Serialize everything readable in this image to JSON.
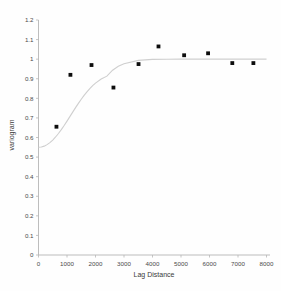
{
  "chart_data": {
    "type": "scatter",
    "title": "",
    "subtitle": "",
    "xlabel": "Lag Distance",
    "ylabel": "variogram",
    "xlim": [
      0,
      8000
    ],
    "ylim": [
      0,
      1.2
    ],
    "grid": false,
    "legend": null,
    "legend_position": "none",
    "xticks": [
      0,
      1000,
      2000,
      3000,
      4000,
      5000,
      6000,
      7000,
      8000
    ],
    "xtick_labels": [
      "0",
      "1000",
      "2000",
      "3000",
      "4000",
      "5000",
      "6000",
      "7000",
      "8000"
    ],
    "yticks": [
      0,
      0.1,
      0.2,
      0.3,
      0.4,
      0.5,
      0.6,
      0.7,
      0.8,
      0.9,
      1,
      1.1,
      1.2
    ],
    "ytick_labels": [
      "0",
      "0.1",
      "0.2",
      "0.3",
      "0.4",
      "0.5",
      "0.6",
      "0.7",
      "0.8",
      "0.9",
      "1",
      "1.1",
      "1.2"
    ],
    "series": [
      {
        "name": "experimental variogram",
        "type": "scatter",
        "marker": "square",
        "color": "#0d0d0d",
        "x": [
          630,
          1120,
          1860,
          2630,
          3510,
          4210,
          5110,
          5950,
          6800,
          7540
        ],
        "y": [
          0.655,
          0.92,
          0.97,
          0.855,
          0.975,
          1.065,
          1.02,
          1.03,
          0.98,
          0.98
        ]
      },
      {
        "name": "fitted model",
        "type": "line",
        "color": "#cfcfcf",
        "model": "gaussian",
        "nugget": 0.55,
        "sill": 1.0,
        "range": 1750,
        "x": [
          0,
          100,
          200,
          300,
          400,
          500,
          600,
          700,
          800,
          900,
          1000,
          1100,
          1200,
          1300,
          1400,
          1500,
          1600,
          1700,
          1800,
          1900,
          2000,
          2200,
          2400,
          2600,
          2800,
          3000,
          3500,
          4000,
          4500,
          5000,
          5500,
          6000,
          6500,
          7000,
          7500,
          8000
        ],
        "y": [
          0.55,
          0.5515,
          0.556,
          0.5635,
          0.5739,
          0.587,
          0.6026,
          0.6205,
          0.6402,
          0.6614,
          0.6837,
          0.7065,
          0.7296,
          0.7523,
          0.7744,
          0.7954,
          0.8151,
          0.8333,
          0.8498,
          0.8645,
          0.8775,
          0.8984,
          0.9133,
          0.9437,
          0.9637,
          0.9762,
          0.9938,
          0.9988,
          0.9998,
          1.0,
          1.0,
          1.0,
          1.0,
          1.0,
          1.0,
          1.0
        ]
      }
    ]
  },
  "axes": {
    "x_title": "Lag Distance",
    "y_title": "variogram"
  }
}
